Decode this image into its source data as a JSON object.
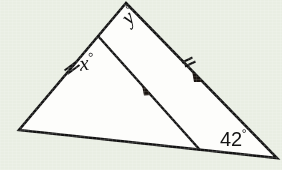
{
  "figure": {
    "kind": "geometry-triangle-diagram",
    "background_color": "#e9eee3",
    "stroke_color": "#131313",
    "fill_color": "#fdfdfb",
    "labels": {
      "x_angle": "x",
      "x_degree_symbol": "°",
      "y_angle": "y",
      "y_degree_symbol": "°",
      "known_angle": "42",
      "known_angle_degree_symbol": "°"
    },
    "vertices": {
      "apex": {
        "x": 126,
        "y": 3
      },
      "left": {
        "x": 19,
        "y": 130
      },
      "right": {
        "x": 277,
        "y": 158
      },
      "cevian_top": {
        "x": 98,
        "y": 36
      },
      "cevian_bottom": {
        "x": 200,
        "y": 150
      }
    },
    "marks": {
      "tick_left_segment": {
        "count": 2,
        "x": 70,
        "y": 67
      },
      "tick_right_segment": {
        "count": 2,
        "x": 188,
        "y": 63
      },
      "arrow_cevian": {
        "x": 150,
        "y": 92
      },
      "arrow_right_side": {
        "x": 200,
        "y": 78
      }
    }
  }
}
